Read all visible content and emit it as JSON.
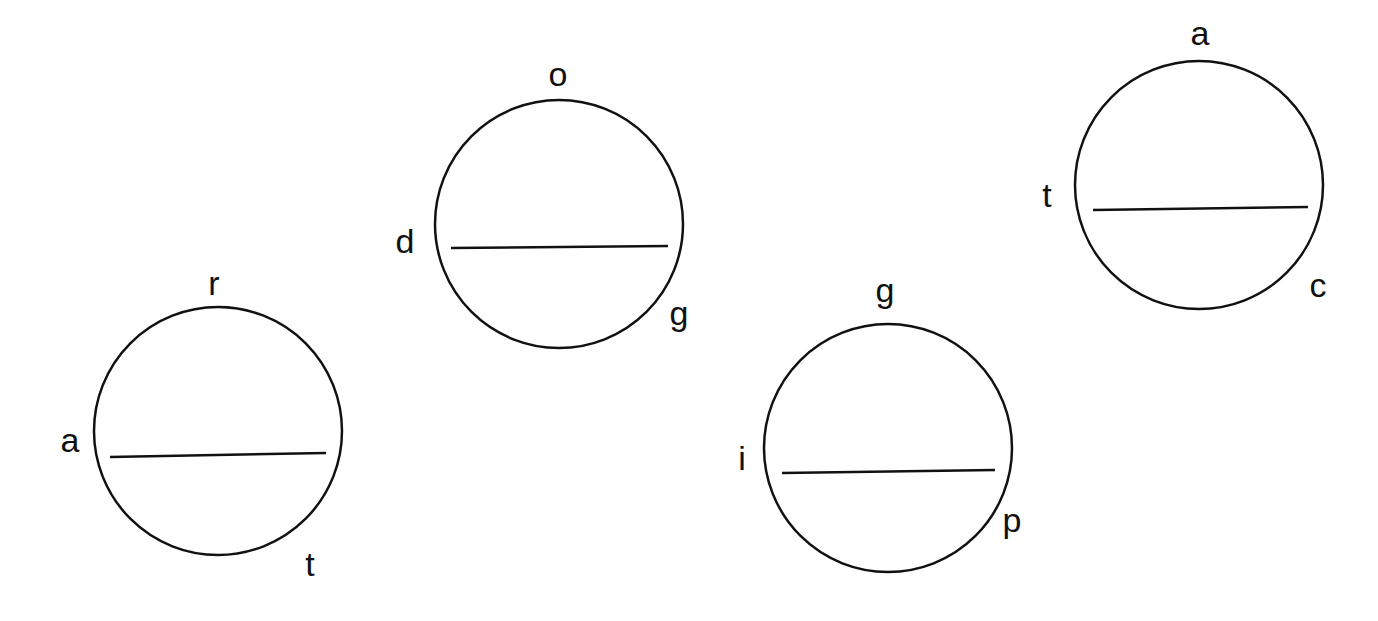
{
  "diagram": {
    "style": {
      "stroke_color": "#111111",
      "background": "#ffffff",
      "stroke_width": 2.5,
      "label_size": 34
    },
    "circles": [
      {
        "id": "circle-1",
        "cx": 218,
        "cy": 431,
        "r": 124,
        "chord": {
          "x1": 110,
          "y1": 457,
          "x2": 326,
          "y2": 453
        },
        "labels": [
          {
            "text": "r",
            "x": 214,
            "y": 295,
            "position": "top"
          },
          {
            "text": "a",
            "x": 70,
            "y": 452,
            "position": "left"
          },
          {
            "text": "t",
            "x": 310,
            "y": 576,
            "position": "bottom-right"
          }
        ]
      },
      {
        "id": "circle-2",
        "cx": 559,
        "cy": 224,
        "r": 124,
        "chord": {
          "x1": 451,
          "y1": 248,
          "x2": 668,
          "y2": 246
        },
        "labels": [
          {
            "text": "o",
            "x": 558,
            "y": 86,
            "position": "top"
          },
          {
            "text": "d",
            "x": 405,
            "y": 253,
            "position": "left"
          },
          {
            "text": "g",
            "x": 679,
            "y": 325,
            "position": "bottom-right"
          }
        ]
      },
      {
        "id": "circle-3",
        "cx": 888,
        "cy": 448,
        "r": 124,
        "chord": {
          "x1": 782,
          "y1": 473,
          "x2": 995,
          "y2": 470
        },
        "labels": [
          {
            "text": "g",
            "x": 885,
            "y": 302,
            "position": "top"
          },
          {
            "text": "i",
            "x": 742,
            "y": 470,
            "position": "left"
          },
          {
            "text": "p",
            "x": 1012,
            "y": 532,
            "position": "bottom-right"
          }
        ]
      },
      {
        "id": "circle-4",
        "cx": 1199,
        "cy": 185,
        "r": 124,
        "chord": {
          "x1": 1093,
          "y1": 210,
          "x2": 1308,
          "y2": 207
        },
        "labels": [
          {
            "text": "a",
            "x": 1200,
            "y": 45,
            "position": "top"
          },
          {
            "text": "t",
            "x": 1047,
            "y": 207,
            "position": "left"
          },
          {
            "text": "c",
            "x": 1318,
            "y": 297,
            "position": "bottom-right"
          }
        ]
      }
    ]
  }
}
